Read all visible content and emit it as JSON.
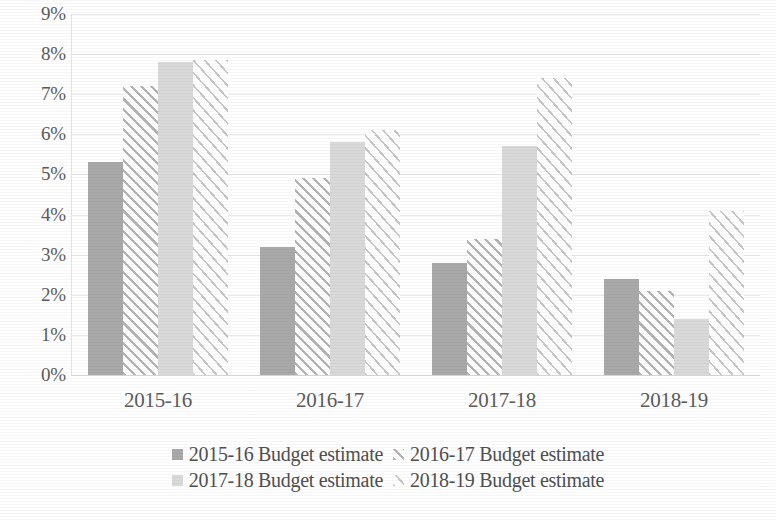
{
  "chart_data": {
    "type": "bar",
    "title": "",
    "subtitle": "",
    "xlabel": "",
    "ylabel": "",
    "categories": [
      "2015-16",
      "2016-17",
      "2017-18",
      "2018-19"
    ],
    "series": [
      {
        "name": "2015-16 Budget estimate",
        "values": [
          5.3,
          3.2,
          2.8,
          2.4
        ],
        "style": "solid-medium-gray",
        "color": "#a9a9a9"
      },
      {
        "name": "2016-17 Budget estimate",
        "values": [
          7.2,
          4.9,
          3.4,
          2.1
        ],
        "style": "diagonal-hatch-forward",
        "color": "#b4b4b4"
      },
      {
        "name": "2017-18 Budget estimate",
        "values": [
          7.8,
          5.8,
          5.7,
          1.4
        ],
        "style": "solid-light-gray",
        "color": "#d9d9d9"
      },
      {
        "name": "2018-19 Budget estimate",
        "values": [
          7.85,
          6.1,
          7.4,
          4.1
        ],
        "style": "diagonal-hatch-fine",
        "color": "#c6c6c6"
      }
    ],
    "ylim": [
      0,
      9
    ],
    "ytick_values": [
      0,
      1,
      2,
      3,
      4,
      5,
      6,
      7,
      8,
      9
    ],
    "ytick_labels": [
      "0%",
      "1%",
      "2%",
      "3%",
      "4%",
      "5%",
      "6%",
      "7%",
      "8%",
      "9%"
    ],
    "value_format": "percent",
    "grid": true,
    "grid_axis": "y",
    "legend_position": "bottom",
    "legend_columns": 2,
    "annotations": []
  },
  "axis": {
    "y": {
      "ticks": [
        {
          "label": "9%",
          "value": 9
        },
        {
          "label": "8%",
          "value": 8
        },
        {
          "label": "7%",
          "value": 7
        },
        {
          "label": "6%",
          "value": 6
        },
        {
          "label": "5%",
          "value": 5
        },
        {
          "label": "4%",
          "value": 4
        },
        {
          "label": "3%",
          "value": 3
        },
        {
          "label": "2%",
          "value": 2
        },
        {
          "label": "1%",
          "value": 1
        },
        {
          "label": "0%",
          "value": 0
        }
      ]
    },
    "x": {
      "ticks": [
        {
          "label": "2015-16"
        },
        {
          "label": "2016-17"
        },
        {
          "label": "2017-18"
        },
        {
          "label": "2018-19"
        }
      ]
    }
  },
  "legend": {
    "rows": [
      [
        {
          "label": "2015-16 Budget estimate",
          "series_index": 0
        },
        {
          "label": "2016-17 Budget estimate",
          "series_index": 1
        }
      ],
      [
        {
          "label": "2017-18 Budget estimate",
          "series_index": 2
        },
        {
          "label": "2018-19 Budget estimate",
          "series_index": 3
        }
      ]
    ]
  },
  "colors": {
    "series_1": "#a9a9a9",
    "series_2": "#b4b4b4",
    "series_3": "#d9d9d9",
    "series_4": "#c6c6c6",
    "gridline": "#e9e9e9",
    "text": "#545454",
    "background": "#ffffff"
  }
}
